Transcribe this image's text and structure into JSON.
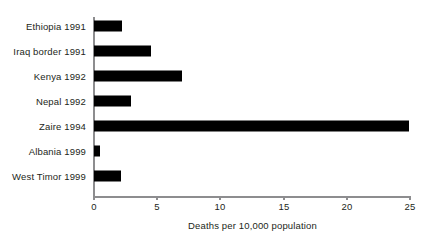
{
  "chart_data": {
    "type": "bar",
    "orientation": "horizontal",
    "title": "",
    "xlabel": "Deaths per 10,000 population",
    "ylabel": "",
    "categories": [
      "Ethiopia 1991",
      "Iraq border 1991",
      "Kenya 1992",
      "Nepal 1992",
      "Zaire 1994",
      "Albania 1999",
      "West Timor 1999"
    ],
    "values": [
      2.2,
      4.5,
      7.0,
      2.9,
      24.9,
      0.5,
      2.1
    ],
    "xlim": [
      0,
      25
    ],
    "xticks": [
      0,
      5,
      10,
      15,
      20,
      25
    ],
    "xtick_labels": [
      "0",
      "5",
      "10",
      "15",
      "20",
      "25"
    ],
    "grid": false,
    "legend": false,
    "bar_color": "#000000",
    "axis_color": "#8d8d8f",
    "text_color": "#231f20"
  }
}
